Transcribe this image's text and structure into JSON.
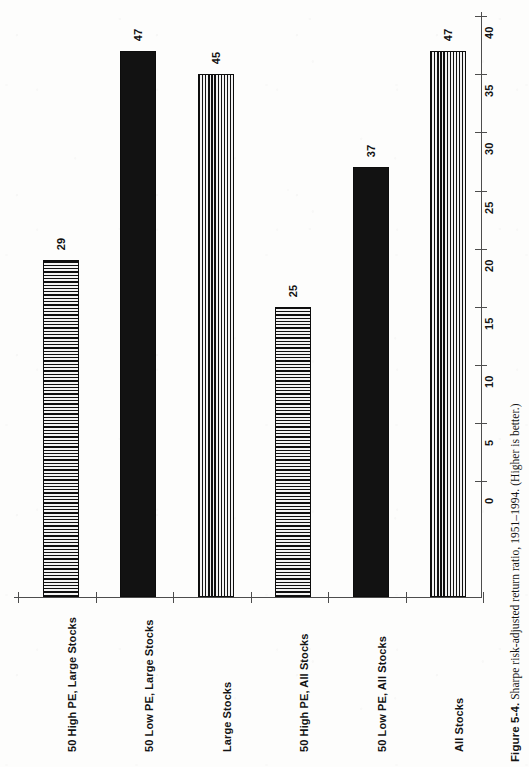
{
  "figure": {
    "label": "Figure 5-4.",
    "caption": "Sharpe risk-adjusted return ratio, 1951–1994. (Higher is better.)"
  },
  "colors": {
    "ink": "#121212",
    "axis": "#4d4d4d",
    "paper": "#fdfdfc"
  },
  "chart_data": {
    "type": "bar",
    "orientation": "vertical-printed-rotated",
    "title": "Sharpe risk-adjusted return ratio, 1951–1994. (Higher is better.)",
    "xlabel": "",
    "ylabel": "",
    "ylim": [
      0,
      50
    ],
    "grid": false,
    "legend": "none",
    "tick_labels": [
      "0",
      "5",
      "10",
      "15",
      "20",
      "25",
      "30",
      "35",
      "40",
      "45",
      "50"
    ],
    "tick_values": [
      0,
      5,
      10,
      15,
      20,
      25,
      30,
      35,
      40,
      45,
      50
    ],
    "categories": [
      "50 High PE, Large Stocks",
      "50 Low PE, Large Stocks",
      "Large Stocks",
      "50 High PE, All Stocks",
      "50 Low PE, All Stocks",
      "All Stocks"
    ],
    "values": [
      29,
      47,
      45,
      25,
      37,
      47
    ],
    "value_labels": [
      "29",
      "47",
      "45",
      "25",
      "37",
      "47"
    ],
    "bar_fills": [
      "hhatch",
      "solid",
      "vstripe",
      "hhatch",
      "solid",
      "vstripe"
    ]
  }
}
